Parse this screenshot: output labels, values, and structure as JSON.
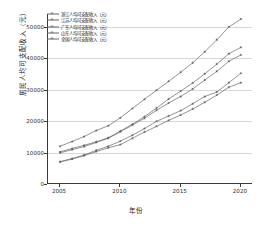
{
  "chart_data": {
    "type": "line",
    "title": "",
    "xlabel": "年份",
    "ylabel": "居民人均可支配收入（元）",
    "xlim": [
      2004,
      2021
    ],
    "ylim": [
      0,
      54000
    ],
    "xticks": [
      2005,
      2010,
      2015,
      2020
    ],
    "yticks": [
      0,
      10000,
      20000,
      30000,
      40000,
      50000
    ],
    "ytick_labels": [
      "0",
      "10000",
      "20000",
      "30000",
      "40000",
      "50000"
    ],
    "xtick_labels": [
      "2005",
      "2010",
      "2015",
      "2020"
    ],
    "grid": "horizontal",
    "legend_position": "upper left",
    "x": [
      2005,
      2006,
      2007,
      2008,
      2009,
      2010,
      2011,
      2012,
      2013,
      2014,
      2015,
      2016,
      2017,
      2018,
      2019,
      2020
    ],
    "series": [
      {
        "name": "浙江人均可支配收入（元）",
        "marker": "star",
        "color": "#666666",
        "values": [
          12000,
          13500,
          15100,
          17000,
          18500,
          21000,
          24000,
          26900,
          29800,
          32600,
          35500,
          38500,
          42000,
          45800,
          49900,
          52400
        ]
      },
      {
        "name": "江苏人均可支配收入（元）",
        "marker": "star",
        "color": "#666666",
        "values": [
          10200,
          11300,
          12300,
          13400,
          14700,
          16800,
          19000,
          21400,
          24100,
          27000,
          29500,
          32100,
          35000,
          38100,
          41400,
          43400
        ]
      },
      {
        "name": "广东人均可支配收入（元）",
        "marker": "star",
        "color": "#666666",
        "values": [
          9900,
          10900,
          11900,
          13200,
          14500,
          16600,
          18700,
          20900,
          23400,
          25700,
          27800,
          30200,
          33000,
          35800,
          39000,
          41000
        ]
      },
      {
        "name": "山东人均可支配收入（元）",
        "marker": "star",
        "color": "#666666",
        "values": [
          7100,
          8100,
          9200,
          10700,
          12000,
          13600,
          15500,
          17600,
          19900,
          21600,
          23300,
          25500,
          27800,
          29200,
          32200,
          35200
        ]
      },
      {
        "name": "全国人均可支配收入（元）",
        "marker": "star",
        "color": "#666666",
        "values": [
          7000,
          7900,
          9000,
          10300,
          11500,
          12500,
          14500,
          16500,
          18300,
          20200,
          21900,
          23800,
          25974,
          28228,
          30733,
          32189
        ]
      }
    ]
  }
}
